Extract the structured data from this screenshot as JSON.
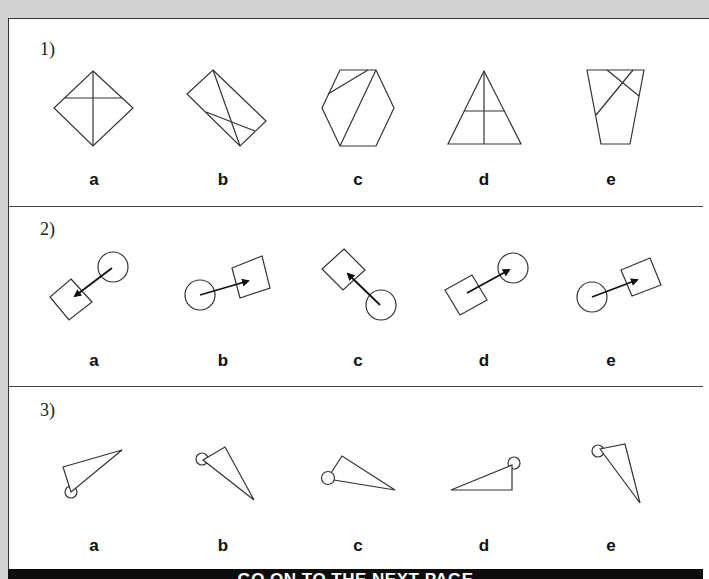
{
  "questions": [
    {
      "number": "1)",
      "options": [
        "a",
        "b",
        "c",
        "d",
        "e"
      ]
    },
    {
      "number": "2)",
      "options": [
        "a",
        "b",
        "c",
        "d",
        "e"
      ]
    },
    {
      "number": "3)",
      "options": [
        "a",
        "b",
        "c",
        "d",
        "e"
      ]
    }
  ],
  "figures": {
    "q1": [
      "diamond-divided",
      "rotated-rectangle-divided",
      "hexagon-divided",
      "triangle-divided",
      "trapezoid-divided"
    ],
    "q2": [
      "circle-arrow-to-square",
      "circle-arrow-to-square",
      "circle-arrow-to-square",
      "square-arrow-to-circle",
      "circle-arrow-to-square"
    ],
    "q3": [
      "triangle-with-circle",
      "triangle-with-circle",
      "triangle-with-circle",
      "triangle-with-circle",
      "triangle-with-circle"
    ]
  },
  "footer": {
    "text": "GO ON TO THE NEXT PAGE"
  },
  "colors": {
    "background": "#d3d3d3",
    "page": "#ffffff",
    "ink": "#222222",
    "footer_bar": "#0d0d0d"
  }
}
